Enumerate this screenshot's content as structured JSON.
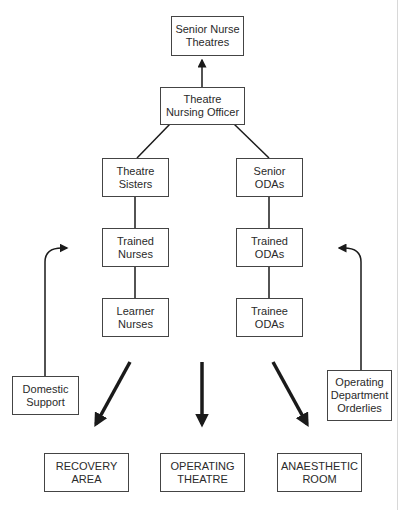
{
  "diagram": {
    "type": "organisational-chart",
    "nodes": {
      "senior_nurse": {
        "line1": "Senior Nurse",
        "line2": "Theatres"
      },
      "tno": {
        "line1": "Theatre",
        "line2": "Nursing Officer"
      },
      "sisters": {
        "line1": "Theatre",
        "line2": "Sisters"
      },
      "senior_odas": {
        "line1": "Senior",
        "line2": "ODAs"
      },
      "trained_nurses": {
        "line1": "Trained",
        "line2": "Nurses"
      },
      "trained_odas": {
        "line1": "Trained",
        "line2": "ODAs"
      },
      "learner_nurses": {
        "line1": "Learner",
        "line2": "Nurses"
      },
      "trainee_odas": {
        "line1": "Trainee",
        "line2": "ODAs"
      },
      "domestic": {
        "line1": "Domestic",
        "line2": "Support"
      },
      "odo": {
        "line1": "Operating",
        "line2": "Department",
        "line3": "Orderlies"
      },
      "recovery": {
        "line1": "RECOVERY",
        "line2": "AREA"
      },
      "operating": {
        "line1": "OPERATING",
        "line2": "THEATRE"
      },
      "anaesthetic": {
        "line1": "ANAESTHETIC",
        "line2": "ROOM"
      }
    },
    "edges": [
      {
        "from": "Theatre Nursing Officer",
        "to": "Senior Nurse Theatres",
        "arrow": true
      },
      {
        "from": "Theatre Nursing Officer",
        "to": "Theatre Sisters",
        "arrow": false
      },
      {
        "from": "Theatre Nursing Officer",
        "to": "Senior ODAs",
        "arrow": false
      },
      {
        "from": "Theatre Sisters",
        "to": "Trained Nurses",
        "arrow": false
      },
      {
        "from": "Trained Nurses",
        "to": "Learner Nurses",
        "arrow": false
      },
      {
        "from": "Senior ODAs",
        "to": "Trained ODAs",
        "arrow": false
      },
      {
        "from": "Trained ODAs",
        "to": "Trainee ODAs",
        "arrow": false
      },
      {
        "from": "Domestic Support",
        "to": "nursing staff",
        "arrow": true
      },
      {
        "from": "Operating Department Orderlies",
        "to": "ODA staff",
        "arrow": true
      },
      {
        "from": "staff",
        "to": "RECOVERY AREA",
        "arrow": true
      },
      {
        "from": "staff",
        "to": "OPERATING THEATRE",
        "arrow": true
      },
      {
        "from": "staff",
        "to": "ANAESTHETIC ROOM",
        "arrow": true
      }
    ],
    "colors": {
      "line": "#1a1a1a",
      "box_border": "#444444",
      "text": "#2a2a2a"
    }
  }
}
